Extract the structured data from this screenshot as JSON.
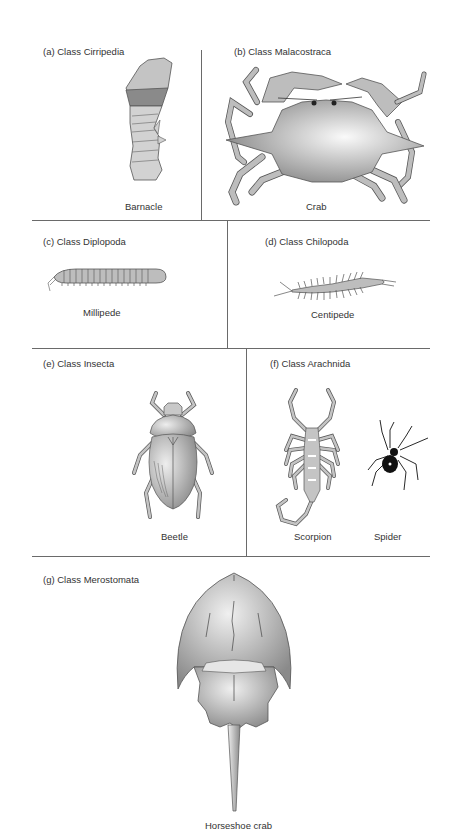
{
  "panels": {
    "a": {
      "title": "(a) Class Cirripedia",
      "organisms": [
        "Barnacle"
      ]
    },
    "b": {
      "title": "(b) Class Malacostraca",
      "organisms": [
        "Crab"
      ]
    },
    "c": {
      "title": "(c) Class Diplopoda",
      "organisms": [
        "Millipede"
      ]
    },
    "d": {
      "title": "(d) Class Chilopoda",
      "organisms": [
        "Centipede"
      ]
    },
    "e": {
      "title": "(e) Class Insecta",
      "organisms": [
        "Beetle"
      ]
    },
    "f": {
      "title": "(f) Class Arachnida",
      "organisms": [
        "Scorpion",
        "Spider"
      ]
    },
    "g": {
      "title": "(g) Class Merostomata",
      "organisms": [
        "Horseshoe crab"
      ]
    }
  },
  "colors": {
    "line": "#6a6a6a",
    "fill": "#b8b8b8",
    "fill_light": "#e6e6e6",
    "stroke": "#555555",
    "dark": "#111111"
  }
}
